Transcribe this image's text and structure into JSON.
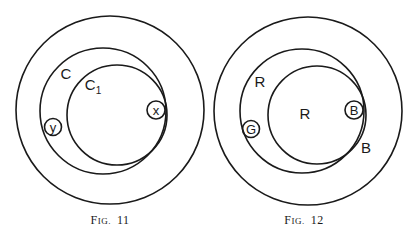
{
  "figures": [
    {
      "caption": "Fig. 11",
      "caption_prefix": "F",
      "caption_smallcaps": "IG.",
      "caption_number": "11",
      "labels": {
        "outer_circle_label": "C",
        "inner_circle_label": "C",
        "inner_circle_subscript": "1",
        "small_circle_left": "y",
        "small_circle_right": "x"
      }
    },
    {
      "caption": "Fig. 12",
      "caption_prefix": "F",
      "caption_smallcaps": "IG.",
      "caption_number": "12",
      "labels": {
        "crescent_label": "R",
        "inner_circle_label": "R",
        "small_circle_left": "G",
        "small_circle_right": "B",
        "outer_ring_label": "B"
      }
    }
  ]
}
